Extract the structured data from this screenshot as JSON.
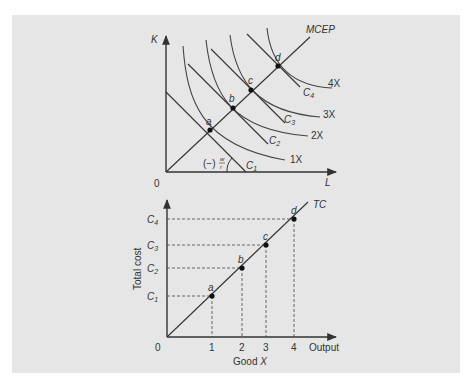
{
  "figure": {
    "background_color": "#e6e6e6",
    "line_color": "#333333"
  },
  "top_chart": {
    "y_axis_label": "K",
    "x_axis_label": "L",
    "origin_label": "0",
    "expansion_path_label": "MCEP",
    "slope_label": "(−)w/r",
    "slope_prefix": "(−)",
    "slope_num": "w",
    "slope_den": "r",
    "points": [
      {
        "label": "a",
        "x": 210,
        "y": 130
      },
      {
        "label": "b",
        "x": 233,
        "y": 108
      },
      {
        "label": "c",
        "x": 251,
        "y": 90
      },
      {
        "label": "d",
        "x": 278,
        "y": 66
      }
    ],
    "isocost_lines": [
      {
        "label": "C",
        "sub": "1"
      },
      {
        "label": "C",
        "sub": "2"
      },
      {
        "label": "C",
        "sub": "3"
      },
      {
        "label": "C",
        "sub": "4"
      }
    ],
    "isoquants": [
      {
        "label": "1X"
      },
      {
        "label": "2X"
      },
      {
        "label": "3X"
      },
      {
        "label": "4X"
      }
    ]
  },
  "bottom_chart": {
    "y_axis_label": "Total cost",
    "x_axis_label": "Output",
    "x_axis_title": "Good X",
    "x_axis_title_prefix": "Good ",
    "x_axis_title_var": "X",
    "origin_label": "0",
    "curve_label": "TC",
    "x_ticks": [
      "1",
      "2",
      "3",
      "4"
    ],
    "y_ticks": [
      {
        "label": "C",
        "sub": "1"
      },
      {
        "label": "C",
        "sub": "2"
      },
      {
        "label": "C",
        "sub": "3"
      },
      {
        "label": "C",
        "sub": "4"
      }
    ],
    "points": [
      {
        "label": "a",
        "output": 1,
        "cost": "C1"
      },
      {
        "label": "b",
        "output": 2,
        "cost": "C2"
      },
      {
        "label": "c",
        "output": 3,
        "cost": "C3"
      },
      {
        "label": "d",
        "output": 4,
        "cost": "C4"
      }
    ]
  }
}
